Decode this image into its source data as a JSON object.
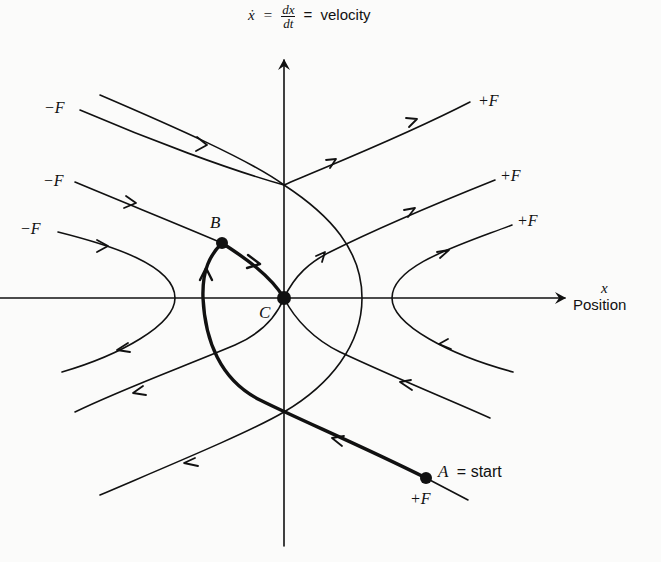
{
  "diagram": {
    "type": "phase-plane trajectory diagram",
    "y_axis": {
      "label_lhs": "ẋ",
      "label_eq1": "=",
      "label_frac_num": "dx",
      "label_frac_den": "dt",
      "label_eq2": "=",
      "label_word": "velocity"
    },
    "x_axis": {
      "label_symbol": "x",
      "label_word": "Position"
    },
    "points": {
      "A": {
        "name": "A",
        "annotation": "= start"
      },
      "B": {
        "name": "B"
      },
      "C": {
        "name": "C"
      }
    },
    "force_labels": {
      "left": [
        "−F",
        "−F",
        "−F"
      ],
      "right": [
        "+F",
        "+F",
        "+F"
      ],
      "bottom": "+F"
    },
    "colors": {
      "ink": "#111111",
      "background": "#fbfbfa"
    }
  }
}
